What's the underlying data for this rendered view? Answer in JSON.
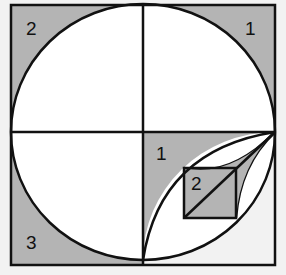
{
  "diagram": {
    "colors": {
      "shade": "#b4b4b4",
      "line": "#111111",
      "background": "#f2f2f2",
      "fill": "#ffffff"
    },
    "labels": {
      "top_left": "2",
      "top_right": "1",
      "bottom_left": "3",
      "center_right": "1",
      "inner_square": "2"
    }
  }
}
